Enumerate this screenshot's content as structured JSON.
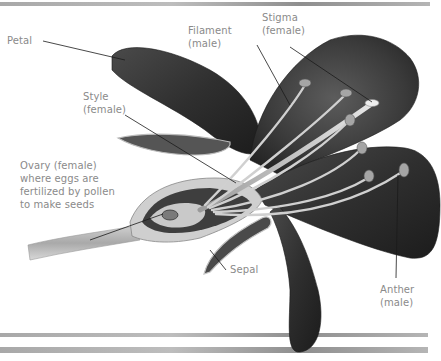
{
  "colors": {
    "petal_dark": "#2e2e2e",
    "petal_mid": "#5a5a5a",
    "stamen_light": "#d9d9d9",
    "label_text": "#8a8a8a",
    "leader_line": "#1a1a1a",
    "rule": "#9a9a9a"
  },
  "labels": {
    "petal": "Petal",
    "filament": {
      "line1": "Filament",
      "line2": "(male)"
    },
    "stigma": {
      "line1": "Stigma",
      "line2": "(female)"
    },
    "style": {
      "line1": "Style",
      "line2": "(female)"
    },
    "ovary": {
      "line1": "Ovary (female)",
      "line2": "where eggs are",
      "line3": "fertilized by pollen",
      "line4": "to make seeds"
    },
    "sepal": "Sepal",
    "anther": {
      "line1": "Anther",
      "line2": "(male)"
    }
  }
}
